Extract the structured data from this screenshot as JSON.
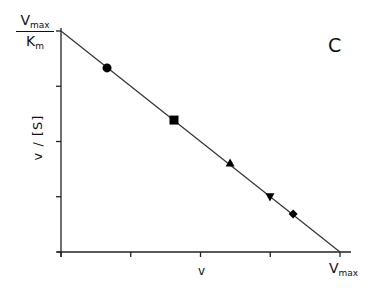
{
  "chart_data": {
    "type": "scatter",
    "title": "",
    "panel_label": "C",
    "plot_kind": "Eadie-Hofstee / Scatchard-type linear plot",
    "xlabel": "v",
    "ylabel": "v / [S]",
    "x_axis_end_label": {
      "main": "V",
      "sub": "max"
    },
    "y_axis_top_label": {
      "numerator_main": "V",
      "numerator_sub": "max",
      "denominator_main": "K",
      "denominator_sub": "m"
    },
    "xlim": [
      0,
      1
    ],
    "ylim": [
      0,
      1
    ],
    "x_units": "fraction of Vmax",
    "y_units": "fraction of Vmax/Km",
    "x_ticks": [
      0,
      0.25,
      0.5,
      0.75,
      1.0
    ],
    "y_ticks": [
      0,
      0.25,
      0.5,
      0.75,
      1.0
    ],
    "grid": false,
    "legend": null,
    "fit_line": {
      "x": [
        0,
        1
      ],
      "y": [
        1,
        0
      ]
    },
    "points": [
      {
        "marker": "circle",
        "x": 0.165,
        "y": 0.833
      },
      {
        "marker": "square",
        "x": 0.405,
        "y": 0.597
      },
      {
        "marker": "triangle-up",
        "x": 0.606,
        "y": 0.403
      },
      {
        "marker": "triangle-down",
        "x": 0.749,
        "y": 0.249
      },
      {
        "marker": "diamond",
        "x": 0.832,
        "y": 0.172
      }
    ]
  },
  "labels": {
    "panel": "C",
    "ylabel": "v  /  [S]",
    "xlabel": "v",
    "vmax_main": "V",
    "vmax_sub": "max",
    "km_main": "K",
    "km_sub": "m"
  }
}
